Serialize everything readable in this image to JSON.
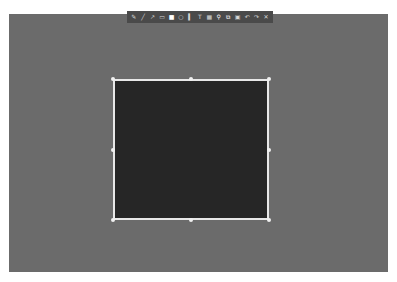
{
  "screen": {
    "background_color": "#6b6b6b"
  },
  "selection": {
    "x": 113,
    "y": 79,
    "width": 156,
    "height": 141,
    "fill_color": "#262626",
    "border_color": "#e8e8e8"
  },
  "toolbar": {
    "tools": [
      {
        "name": "pencil-tool",
        "glyph": "✎"
      },
      {
        "name": "line-tool",
        "glyph": "╱"
      },
      {
        "name": "arrow-tool",
        "glyph": "↗"
      },
      {
        "name": "selection-tool",
        "glyph": "▭"
      },
      {
        "name": "rectangle-tool",
        "glyph": "■"
      },
      {
        "name": "circle-tool",
        "glyph": "○"
      },
      {
        "name": "marker-tool",
        "glyph": "▍"
      },
      {
        "name": "text-tool",
        "glyph": "T"
      },
      {
        "name": "pixelate-tool",
        "glyph": "▦"
      },
      {
        "name": "pin-tool",
        "glyph": "⚲"
      },
      {
        "name": "copy-tool",
        "glyph": "⧉"
      },
      {
        "name": "save-tool",
        "glyph": "▣"
      },
      {
        "name": "undo-tool",
        "glyph": "↶"
      },
      {
        "name": "redo-tool",
        "glyph": "↷"
      },
      {
        "name": "exit-tool",
        "glyph": "✕"
      }
    ]
  }
}
